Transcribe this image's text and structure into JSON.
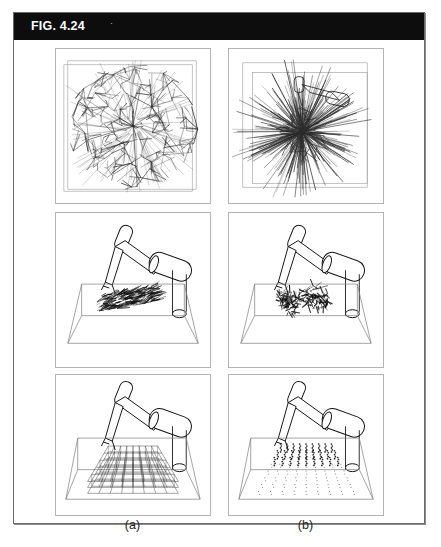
{
  "figure": {
    "header_label": "FIG. 4.24",
    "header_mark": "·",
    "header_bg": "#0d0d0d",
    "header_text_color": "#ffffff",
    "plate_border_color": "#6a6a6a",
    "panel_border_color": "#b4b4b4",
    "background": "#ffffff",
    "ink_color": "#111111"
  },
  "columns": [
    {
      "key": "a",
      "caption": "(a)"
    },
    {
      "key": "b",
      "caption": "(b)"
    }
  ],
  "panels": {
    "r1c1": {
      "name": "dense-random-tree-square",
      "description": "Dense random tree edges filling a square frame",
      "frame": "square",
      "edge_count": 420,
      "fill_style": "uniform-dense"
    },
    "r1c2": {
      "name": "radial-burst-tree-square",
      "description": "Radially biased random tree burst with robot outline overlay",
      "frame": "square",
      "edge_count": 300,
      "fill_style": "radial-burst"
    },
    "r2c1": {
      "name": "robot-workspace-dense-swath",
      "description": "Articulated robot arm above wireframe workspace box with dense swath of reachable samples",
      "sample_style": "dense-swath",
      "sample_count": 260
    },
    "r2c2": {
      "name": "robot-workspace-scatter-clump",
      "description": "Articulated robot arm above wireframe workspace box with irregular clumped samples",
      "sample_style": "clumped-scatter",
      "sample_count": 200
    },
    "r3c1": {
      "name": "robot-workspace-grid-lattice",
      "description": "Articulated robot arm above wireframe workspace box with regular 3D grid lattice",
      "sample_style": "grid-lattice",
      "grid_cols": 9,
      "grid_rows": 6,
      "grid_layers": 3
    },
    "r3c2": {
      "name": "robot-workspace-dot-lattice",
      "description": "Articulated robot arm above wireframe workspace box with regular dotted point lattice",
      "sample_style": "dot-lattice",
      "grid_cols": 9,
      "grid_rows": 8
    }
  }
}
